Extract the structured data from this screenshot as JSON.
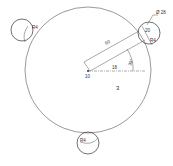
{
  "drawing": {
    "type": "sketch",
    "main_circle": {
      "cx": 88,
      "cy": 70,
      "r": 63
    },
    "holes": [
      {
        "name": "top-left",
        "cx": 22,
        "cy": 30,
        "r": 11,
        "label": "R4"
      },
      {
        "name": "top-right",
        "cx": 149,
        "cy": 33,
        "r": 11,
        "label": "R4",
        "inner_label": "20"
      },
      {
        "name": "bottom",
        "cx": 88,
        "cy": 143,
        "r": 11,
        "label": "R4"
      }
    ],
    "labels": {
      "diameter": "Ø 28",
      "radial_length": "60",
      "horizontal": "18",
      "angle": "30°",
      "center": "10",
      "region": "3"
    },
    "colors": {
      "line": "#444444",
      "text": "#333333",
      "background": "#ffffff"
    }
  }
}
